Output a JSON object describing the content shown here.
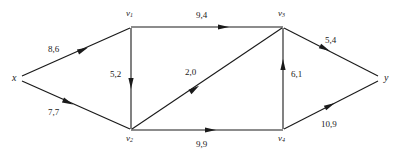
{
  "figure": {
    "type": "flow-network-graph",
    "label_format": "capacity,flow",
    "line_color": "#1a1a1a",
    "background_color": "#ffffff"
  },
  "nodes": [
    {
      "id": "x",
      "label": "x",
      "sub": "",
      "x": 18,
      "y": 78,
      "label_x": 12,
      "label_y": 73,
      "role": "source"
    },
    {
      "id": "v1",
      "label": "v",
      "sub": "1",
      "x": 131,
      "y": 27,
      "label_x": 126,
      "label_y": 9,
      "role": "internal"
    },
    {
      "id": "v2",
      "label": "v",
      "sub": "2",
      "x": 131,
      "y": 130,
      "label_x": 126,
      "label_y": 134,
      "role": "internal"
    },
    {
      "id": "v3",
      "label": "v",
      "sub": "3",
      "x": 283,
      "y": 27,
      "label_x": 278,
      "label_y": 9,
      "role": "internal"
    },
    {
      "id": "v4",
      "label": "v",
      "sub": "4",
      "x": 283,
      "y": 130,
      "label_x": 278,
      "label_y": 134,
      "role": "internal"
    },
    {
      "id": "y",
      "label": "y",
      "sub": "",
      "x": 381,
      "y": 78,
      "label_x": 384,
      "label_y": 73,
      "role": "sink"
    }
  ],
  "edges": [
    {
      "id": "e-x-v1",
      "from": "x",
      "to": "v1",
      "capacity": 8,
      "flow": 6,
      "label": "8,6",
      "label_x": 48,
      "label_y": 45
    },
    {
      "id": "e-x-v2",
      "from": "x",
      "to": "v2",
      "capacity": 7,
      "flow": 7,
      "label": "7,7",
      "label_x": 48,
      "label_y": 108
    },
    {
      "id": "e-v1-v3",
      "from": "v1",
      "to": "v3",
      "capacity": 9,
      "flow": 4,
      "label": "9,4",
      "label_x": 196,
      "label_y": 11
    },
    {
      "id": "e-v1-v2",
      "from": "v1",
      "to": "v2",
      "capacity": 5,
      "flow": 2,
      "label": "5,2",
      "label_x": 110,
      "label_y": 70
    },
    {
      "id": "e-v2-v3",
      "from": "v2",
      "to": "v3",
      "capacity": 2,
      "flow": 0,
      "label": "2,0",
      "label_x": 185,
      "label_y": 68
    },
    {
      "id": "e-v2-v4",
      "from": "v2",
      "to": "v4",
      "capacity": 9,
      "flow": 9,
      "label": "9,9",
      "label_x": 196,
      "label_y": 140
    },
    {
      "id": "e-v4-v3",
      "from": "v4",
      "to": "v3",
      "capacity": 6,
      "flow": 1,
      "label": "6,1",
      "label_x": 291,
      "label_y": 70
    },
    {
      "id": "e-v3-y",
      "from": "v3",
      "to": "y",
      "capacity": 5,
      "flow": 4,
      "label": "5,4",
      "label_x": 325,
      "label_y": 36
    },
    {
      "id": "e-v4-y",
      "from": "v4",
      "to": "y",
      "capacity": 10,
      "flow": 9,
      "label": "10,9",
      "label_x": 321,
      "label_y": 120
    }
  ],
  "top_partial_text": ""
}
